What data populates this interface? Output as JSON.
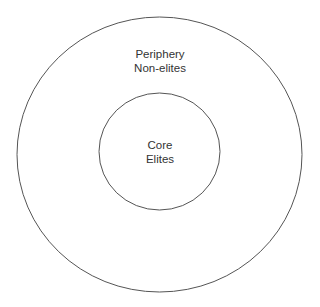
{
  "diagram": {
    "title": "",
    "outer": {
      "label_line1": "Periphery",
      "label_line2": "Non-elites"
    },
    "inner": {
      "label_line1": "Core",
      "label_line2": "Elites"
    },
    "stroke_color": "#555555",
    "background": "#ffffff"
  }
}
